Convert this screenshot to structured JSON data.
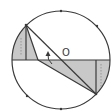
{
  "diagram": {
    "type": "circle-geometry",
    "labels": {
      "center": "O"
    },
    "colors": {
      "stroke": "#3a3a3a",
      "shade": "#c8c8c8",
      "background": "#ffffff"
    },
    "circle": {
      "cx": 61,
      "cy": 60,
      "r": 49
    },
    "diameter": {
      "x1": 12,
      "y1": 60,
      "x2": 110,
      "y2": 60
    },
    "points": {
      "A": {
        "x": 26,
        "y": 25
      },
      "B": {
        "x": 96,
        "y": 94
      },
      "P": {
        "x": 38,
        "y": 60
      },
      "A_foot": {
        "x": 26,
        "y": 60
      },
      "B_foot": {
        "x": 96,
        "y": 60
      }
    },
    "circle_ticks": [
      {
        "x": 61,
        "y": 11
      },
      {
        "x": 97,
        "y": 26
      },
      {
        "x": 61,
        "y": 109
      },
      {
        "x": 27,
        "y": 96
      }
    ],
    "arrow": {
      "direction": "up",
      "note": "rotation indicator near center"
    }
  }
}
